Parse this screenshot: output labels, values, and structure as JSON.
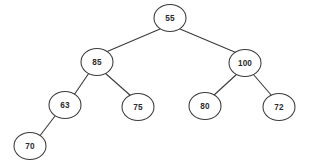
{
  "diagram": {
    "type": "binary-tree",
    "background_color": "#ffffff",
    "node_fill_color": "#ffffff",
    "node_stroke_color": "#3a3a3a",
    "edge_color": "#3a3a3a",
    "text_color": "#2b2b2b",
    "node_shape": "ellipse",
    "node_width": 32,
    "node_height": 27,
    "nodes": [
      {
        "id": "n55",
        "label": "55",
        "cx": 170,
        "cy": 18,
        "rx": 16,
        "ry": 13.5,
        "level": 0
      },
      {
        "id": "n85",
        "label": "85",
        "cx": 97,
        "cy": 62,
        "rx": 16,
        "ry": 13.5,
        "level": 1
      },
      {
        "id": "n100",
        "label": "100",
        "cx": 245,
        "cy": 63,
        "rx": 16,
        "ry": 13.5,
        "level": 1
      },
      {
        "id": "n63",
        "label": "63",
        "cx": 65,
        "cy": 105,
        "rx": 16,
        "ry": 13.5,
        "level": 2
      },
      {
        "id": "n75",
        "label": "75",
        "cx": 138,
        "cy": 107,
        "rx": 16,
        "ry": 13.5,
        "level": 2
      },
      {
        "id": "n80",
        "label": "80",
        "cx": 205,
        "cy": 106,
        "rx": 16,
        "ry": 13.5,
        "level": 2
      },
      {
        "id": "n72",
        "label": "72",
        "cx": 279,
        "cy": 107,
        "rx": 16,
        "ry": 13.5,
        "level": 2
      },
      {
        "id": "n70",
        "label": "70",
        "cx": 30,
        "cy": 146,
        "rx": 16,
        "ry": 13.5,
        "level": 3
      }
    ],
    "edges": [
      {
        "id": "e55-85",
        "from": "n55",
        "to": "n85",
        "side": "left",
        "x1": 160,
        "y1": 29,
        "x2": 106,
        "y2": 52
      },
      {
        "id": "e55-100",
        "from": "n55",
        "to": "n100",
        "side": "right",
        "x1": 180,
        "y1": 29,
        "x2": 237,
        "y2": 53
      },
      {
        "id": "e85-63",
        "from": "n85",
        "to": "n63",
        "side": "left",
        "x1": 89,
        "y1": 73,
        "x2": 74,
        "y2": 95
      },
      {
        "id": "e85-75",
        "from": "n85",
        "to": "n75",
        "side": "right",
        "x1": 105,
        "y1": 73,
        "x2": 131,
        "y2": 96
      },
      {
        "id": "e100-80",
        "from": "n100",
        "to": "n80",
        "side": "left",
        "x1": 237,
        "y1": 74,
        "x2": 213,
        "y2": 96
      },
      {
        "id": "e100-72",
        "from": "n100",
        "to": "n72",
        "side": "right",
        "x1": 253,
        "y1": 74,
        "x2": 272,
        "y2": 96
      },
      {
        "id": "e63-70",
        "from": "n63",
        "to": "n70",
        "side": "left",
        "x1": 55,
        "y1": 116,
        "x2": 39,
        "y2": 137
      }
    ],
    "structure": {
      "root": "55",
      "adjacency": [
        {
          "parent": "55",
          "left": "85",
          "right": "100"
        },
        {
          "parent": "85",
          "left": "63",
          "right": "75"
        },
        {
          "parent": "100",
          "left": "80",
          "right": "72"
        },
        {
          "parent": "63",
          "left": "70",
          "right": null
        },
        {
          "parent": "75",
          "left": null,
          "right": null
        },
        {
          "parent": "80",
          "left": null,
          "right": null
        },
        {
          "parent": "72",
          "left": null,
          "right": null
        },
        {
          "parent": "70",
          "left": null,
          "right": null
        }
      ]
    }
  }
}
